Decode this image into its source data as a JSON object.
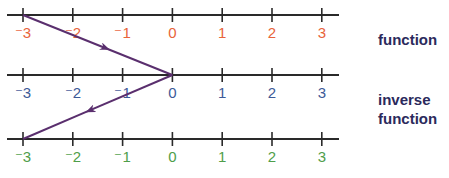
{
  "number_lines": [
    {
      "name": "domain",
      "color": "#e8643a",
      "ticks": [
        "⁻3",
        "⁻2",
        "⁻1",
        "0",
        "1",
        "2",
        "3"
      ]
    },
    {
      "name": "range",
      "color": "#3d5a98",
      "ticks": [
        "⁻3",
        "⁻2",
        "⁻1",
        "0",
        "1",
        "2",
        "3"
      ]
    },
    {
      "name": "inverse-range",
      "color": "#4f9e4a",
      "ticks": [
        "⁻3",
        "⁻2",
        "⁻1",
        "0",
        "1",
        "2",
        "3"
      ]
    }
  ],
  "tick_values": [
    -3,
    -2,
    -1,
    0,
    1,
    2,
    3
  ],
  "mappings": [
    {
      "label": "function",
      "from_line": 0,
      "from_value": -3,
      "to_line": 1,
      "to_value": 0
    },
    {
      "label": "inverse function",
      "from_line": 1,
      "from_value": 0,
      "to_line": 2,
      "to_value": -3
    }
  ],
  "labels": {
    "function": "function",
    "inverse_line1": "inverse",
    "inverse_line2": "function"
  },
  "arrow_color": "#5a2f6e",
  "axis_color": "#2a2a2a"
}
